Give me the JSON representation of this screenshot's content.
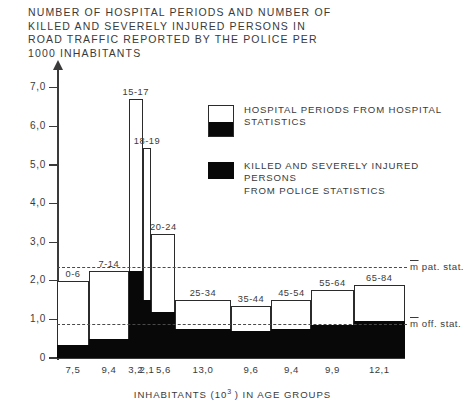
{
  "title": "NUMBER OF HOSPITAL PERIODS AND NUMBER OF\nKILLED AND SEVERELY INJURED PERSONS IN\nROAD TRAFFIC REPORTED BY THE POLICE PER\n1000 INHABITANTS",
  "axis": {
    "y_ticks": [
      "7,0",
      "6,0",
      "5,0",
      "4,0",
      "3,0",
      "2,0",
      "1,0",
      "0"
    ],
    "x_title_pre": "INHABITANTS  (10",
    "x_title_sup": "3",
    "x_title_post": " ) IN AGE  GROUPS"
  },
  "legend": {
    "items": [
      {
        "style": "split",
        "label": "HOSPITAL PERIODS FROM  HOSPITAL\nSTATISTICS"
      },
      {
        "style": "solid",
        "label": "KILLED AND SEVERELY  INJURED  PERSONS\nFROM  POLICE  STATISTICS"
      }
    ]
  },
  "mean_lines": [
    {
      "name": "pat",
      "value": 2.35,
      "label_m": "m",
      "label_rest": " pat. stat."
    },
    {
      "name": "off",
      "value": 0.88,
      "label_m": "m",
      "label_rest": " off. stat."
    }
  ],
  "colors": {
    "hospital_fill": "#ffffff",
    "police_fill": "#080808",
    "stroke": "#2b2b2b",
    "text": "#3a3a3a"
  },
  "chart_data": {
    "type": "bar",
    "title": "NUMBER OF HOSPITAL PERIODS AND NUMBER OF KILLED AND SEVERELY INJURED PERSONS IN ROAD TRAFFIC REPORTED BY THE POLICE PER 1000 INHABITANTS",
    "xlabel": "INHABITANTS (10^3) IN AGE GROUPS",
    "ylabel": "",
    "ylim": [
      0,
      7.3
    ],
    "grid": false,
    "legend_position": "upper-right",
    "note": "Variable-width histogram: bar widths proportional to population (10^3) of each age group.",
    "categories": [
      "0-6",
      "7-14",
      "15-17",
      "18-19",
      "20-24",
      "25-34",
      "35-44",
      "45-54",
      "55-64",
      "65-84"
    ],
    "widths": [
      7.5,
      9.4,
      3.2,
      2.1,
      5.6,
      13.0,
      9.6,
      9.4,
      9.9,
      12.1
    ],
    "width_labels": [
      "7,5",
      "9,4",
      "3,2",
      "2,1",
      "5,6",
      "13,0",
      "9,6",
      "9,4",
      "9,9",
      "12,1"
    ],
    "series": [
      {
        "name": "HOSPITAL PERIODS FROM HOSPITAL STATISTICS",
        "values": [
          2.0,
          2.25,
          6.7,
          5.45,
          3.2,
          1.5,
          1.35,
          1.5,
          1.75,
          1.9
        ]
      },
      {
        "name": "KILLED AND SEVERELY INJURED PERSONS FROM POLICE STATISTICS",
        "values": [
          0.33,
          0.5,
          2.25,
          1.5,
          1.2,
          0.75,
          0.7,
          0.75,
          0.85,
          0.95
        ]
      }
    ],
    "annotations": [
      {
        "text": "m pat. stat.",
        "y": 2.35,
        "type": "hline"
      },
      {
        "text": "m off. stat.",
        "y": 0.88,
        "type": "hline"
      }
    ]
  }
}
